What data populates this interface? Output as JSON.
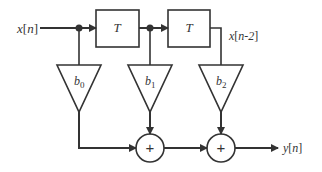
{
  "diagram": {
    "type": "FIR filter block diagram (direct form, 2 delays)",
    "input_label": {
      "text": "x",
      "open": "[",
      "index": "n",
      "close": "]"
    },
    "tap_label": {
      "text": "x",
      "open": "[",
      "index": "n-2",
      "close": "]"
    },
    "output_label": {
      "text": "y",
      "open": "[",
      "index": "n",
      "close": "]"
    },
    "delays": [
      {
        "label": "T"
      },
      {
        "label": "T"
      }
    ],
    "gains": [
      {
        "base": "b",
        "sub": "0"
      },
      {
        "base": "b",
        "sub": "1"
      },
      {
        "base": "b",
        "sub": "2"
      }
    ],
    "adders": [
      {
        "symbol": "+"
      },
      {
        "symbol": "+"
      }
    ],
    "colors": {
      "line": "#333333",
      "background": "#ffffff"
    }
  }
}
